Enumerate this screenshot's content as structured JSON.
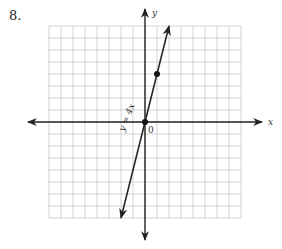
{
  "problem": {
    "number": "8."
  },
  "chart_data": {
    "type": "line",
    "title": "",
    "xlabel": "x",
    "ylabel": "y",
    "origin_label": "0",
    "equation_label": "y = 4x",
    "grid": true,
    "grid_cells": {
      "columns": 16,
      "rows": 16
    },
    "xlim": [
      -8,
      8
    ],
    "ylim": [
      -8,
      8
    ],
    "series": [
      {
        "name": "y = 4x",
        "equation": "y = 4x",
        "slope": 4,
        "intercept": 0,
        "x": [
          -2,
          0,
          1,
          2
        ],
        "y": [
          -8,
          0,
          4,
          8
        ]
      }
    ],
    "plotted_points": [
      {
        "x": 0,
        "y": 0
      },
      {
        "x": 1,
        "y": 4
      }
    ]
  },
  "colors": {
    "grid": "#c8c8c8",
    "axis": "#222222",
    "line": "#222222"
  }
}
